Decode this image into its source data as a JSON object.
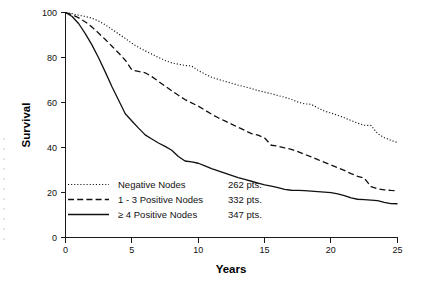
{
  "chart_data": {
    "type": "line",
    "title": "",
    "subtitle": "",
    "xlabel": "Years",
    "ylabel": "Survival",
    "xlim": [
      0,
      25
    ],
    "ylim": [
      0,
      100
    ],
    "xticks": [
      "0",
      "5",
      "10",
      "15",
      "20",
      "25"
    ],
    "yticks": [
      "0",
      "20",
      "40",
      "60",
      "80",
      "100"
    ],
    "xtick_values": [
      0,
      5,
      10,
      15,
      20,
      25
    ],
    "ytick_values": [
      0,
      20,
      40,
      60,
      80,
      100
    ],
    "grid": false,
    "legend_position": "inside-lower-left",
    "series": [
      {
        "name": "Negative Nodes",
        "count_label": "262 pts.",
        "linestyle": "dotted",
        "color": "#111111",
        "x": [
          0,
          0.5,
          1,
          1.5,
          2,
          2.5,
          3,
          3.5,
          4,
          4.5,
          5,
          5.5,
          6,
          6.5,
          7,
          7.5,
          8,
          8.5,
          9,
          9.5,
          10,
          10.5,
          11,
          11.5,
          12,
          12.5,
          13,
          13.5,
          14,
          14.5,
          15,
          15.5,
          16,
          16.5,
          17,
          17.5,
          18,
          18.5,
          19,
          19.5,
          20,
          20.5,
          21,
          21.5,
          22,
          22.5,
          23,
          23.5,
          24,
          24.5,
          25
        ],
        "y": [
          100,
          99.5,
          98.8,
          98.2,
          97.5,
          96.2,
          94.5,
          92.5,
          90.5,
          88.5,
          86.3,
          84.5,
          83.0,
          81.5,
          80.0,
          78.7,
          77.6,
          77.0,
          76.5,
          76.2,
          74.2,
          72.6,
          71.2,
          70.3,
          69.4,
          68.6,
          67.7,
          67.0,
          66.2,
          65.3,
          64.6,
          63.9,
          63.1,
          62.3,
          61.4,
          60.2,
          59.4,
          59.2,
          57.6,
          56.2,
          55.3,
          54.3,
          53.2,
          52.0,
          50.8,
          49.9,
          49.8,
          46.2,
          44.4,
          43.2,
          42.2
        ]
      },
      {
        "name": "1 - 3 Positive Nodes",
        "count_label": "332 pts.",
        "linestyle": "dashed",
        "color": "#111111",
        "x": [
          0,
          0.5,
          1,
          1.5,
          2,
          2.5,
          3,
          3.5,
          4,
          4.5,
          5,
          5.5,
          6,
          6.5,
          7,
          7.5,
          8,
          8.5,
          9,
          9.5,
          10,
          10.5,
          11,
          11.5,
          12,
          12.5,
          13,
          13.5,
          14,
          14.5,
          15,
          15.5,
          16,
          16.5,
          17,
          17.5,
          18,
          18.5,
          19,
          19.5,
          20,
          20.5,
          21,
          21.5,
          22,
          22.5,
          23,
          23.5,
          24,
          24.5,
          25
        ],
        "y": [
          100,
          99.0,
          97.6,
          95.8,
          93.5,
          90.8,
          88.0,
          85.0,
          82.0,
          78.8,
          74.5,
          73.8,
          73.2,
          71.5,
          69.4,
          67.3,
          65.2,
          63.2,
          61.3,
          59.8,
          58.4,
          56.6,
          54.8,
          53.2,
          51.8,
          50.4,
          49.0,
          47.6,
          46.2,
          45.5,
          44.2,
          41.0,
          40.6,
          39.8,
          39.2,
          38.2,
          37.0,
          35.8,
          34.6,
          33.4,
          32.2,
          31.0,
          29.8,
          28.4,
          27.2,
          26.4,
          22.6,
          21.6,
          21.2,
          20.9,
          20.8
        ]
      },
      {
        "name": "≥ 4 Positive Nodes",
        "count_label": "347 pts.",
        "linestyle": "solid",
        "color": "#111111",
        "x": [
          0,
          0.5,
          1,
          1.5,
          2,
          2.5,
          3,
          3.5,
          4,
          4.5,
          5,
          5.5,
          6,
          6.5,
          7,
          7.5,
          8,
          8.5,
          9,
          9.5,
          10,
          10.5,
          11,
          11.5,
          12,
          12.5,
          13,
          13.5,
          14,
          14.5,
          15,
          15.5,
          16,
          16.5,
          17,
          17.5,
          18,
          18.5,
          19,
          19.5,
          20,
          20.5,
          21,
          21.5,
          22,
          22.5,
          23,
          23.5,
          24,
          24.5,
          25
        ],
        "y": [
          100,
          98.2,
          95.0,
          90.5,
          85.5,
          79.8,
          73.5,
          67.0,
          61.0,
          55.0,
          51.8,
          48.6,
          45.6,
          43.8,
          42.0,
          40.5,
          38.8,
          36.0,
          34.0,
          33.6,
          33.0,
          31.8,
          30.6,
          29.6,
          28.6,
          27.6,
          26.6,
          25.8,
          25.0,
          24.2,
          23.4,
          22.8,
          22.2,
          21.4,
          21.0,
          20.9,
          20.8,
          20.6,
          20.4,
          20.2,
          19.9,
          19.4,
          18.6,
          17.6,
          17.0,
          16.8,
          16.6,
          16.4,
          15.6,
          15.1,
          15.0
        ]
      }
    ],
    "legend_entries": [
      {
        "label": "Negative Nodes",
        "count": "262 pts.",
        "style": "dotted"
      },
      {
        "label": "1 - 3 Positive Nodes",
        "count": "332 pts.",
        "style": "dashed"
      },
      {
        "label": "≥ 4 Positive Nodes",
        "count": "347 pts.",
        "style": "solid"
      }
    ]
  }
}
